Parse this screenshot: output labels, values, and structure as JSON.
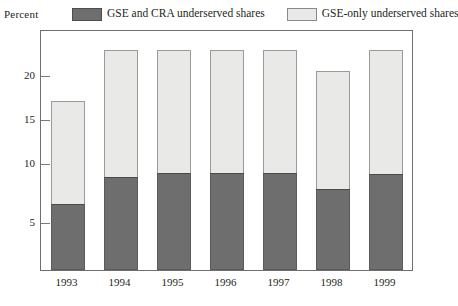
{
  "axis": {
    "y_axis_title": "Percent",
    "y_tick_labels": [
      "20",
      "15",
      "10",
      "5"
    ],
    "x_tick_labels": [
      "1993",
      "1994",
      "1995",
      "1996",
      "1997",
      "1998",
      "1999"
    ]
  },
  "legend": {
    "items": [
      {
        "label": "GSE and CRA underserved shares",
        "swatch": "dark-swatch-icon",
        "color": "#6e6e6e"
      },
      {
        "label": "GSE-only underserved shares",
        "swatch": "light-swatch-icon",
        "color": "#e9e9e7"
      }
    ]
  },
  "chart_data": {
    "type": "bar",
    "stacked": true,
    "title": "",
    "subtitle": "",
    "xlabel": "",
    "ylabel": "Percent",
    "categories": [
      "1993",
      "1994",
      "1995",
      "1996",
      "1997",
      "1998",
      "1999"
    ],
    "series": [
      {
        "name": "GSE and CRA underserved shares",
        "color": "#6e6e6e",
        "values": [
          7.0,
          9.9,
          10.4,
          10.3,
          10.4,
          8.6,
          10.2
        ]
      },
      {
        "name": "GSE-only underserved shares",
        "color": "#e9e9e7",
        "values": [
          11.0,
          13.6,
          13.1,
          13.2,
          13.1,
          12.6,
          13.3
        ]
      }
    ],
    "totals": [
      18.0,
      23.5,
      23.5,
      23.5,
      23.5,
      21.2,
      23.5
    ],
    "ylim": [
      0,
      25.5
    ],
    "yticks": [
      5,
      10,
      15,
      20
    ],
    "grid": false,
    "legend_position": "top"
  }
}
